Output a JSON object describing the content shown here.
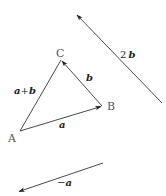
{
  "diagram": {
    "points": {
      "A": {
        "label": "A",
        "x": 20,
        "y": 131
      },
      "B": {
        "label": "B",
        "x": 102,
        "y": 106
      },
      "C": {
        "label": "C",
        "x": 61,
        "y": 60
      }
    },
    "vectors": [
      {
        "id": "a",
        "from": "A",
        "to": "B",
        "label": "a"
      },
      {
        "id": "b",
        "from": "B",
        "to": "C",
        "label": "b"
      },
      {
        "id": "a_plus_b",
        "from": "A",
        "to": "C",
        "label_parts": [
          "a",
          "+",
          "b"
        ]
      },
      {
        "id": "two_b",
        "from": [
          162,
          103
        ],
        "to": [
          76,
          14
        ],
        "label_parts": [
          "2",
          "b"
        ]
      },
      {
        "id": "neg_a",
        "from": [
          103,
          163
        ],
        "to": [
          18,
          192
        ],
        "label_parts": [
          "−",
          "a"
        ]
      }
    ],
    "labels": {
      "point_A": "A",
      "point_B": "B",
      "point_C": "C",
      "vec_a": "a",
      "vec_b": "b",
      "vec_apb_a": "a",
      "vec_apb_plus": "+",
      "vec_apb_b": "b",
      "vec_2b_coef": "2",
      "vec_2b_b": "b",
      "vec_nega_minus": "−",
      "vec_nega_a": "a"
    },
    "colors": {
      "line": "#333333",
      "point_label": "#555555",
      "vector_label": "#222222",
      "background": "#ffffff"
    }
  }
}
